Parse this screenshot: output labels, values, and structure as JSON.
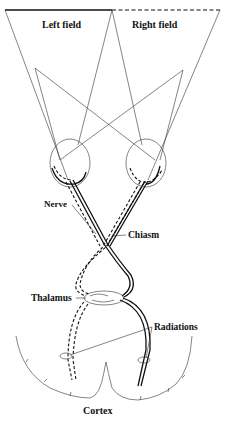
{
  "diagram": {
    "labels": {
      "left_field": "Left field",
      "right_field": "Right field",
      "nerve": "Nerve",
      "chiasm": "Chiasm",
      "thalamus": "Thalamus",
      "radiations": "Radiations",
      "cortex": "Cortex"
    },
    "colors": {
      "ink": "#111111",
      "background": "#ffffff"
    }
  }
}
